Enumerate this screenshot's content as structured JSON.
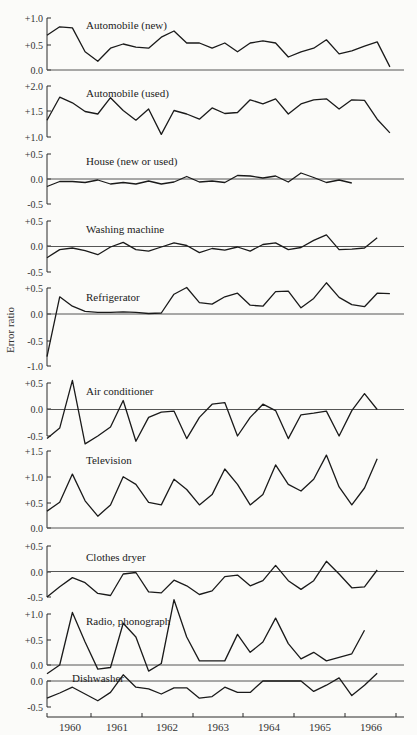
{
  "chart_data": {
    "type": "line",
    "title": "",
    "xlabel": "",
    "ylabel": "Error ratio",
    "x_tick_labels": [
      "1960",
      "1961",
      "1962",
      "1963",
      "1964",
      "1965",
      "1966"
    ],
    "frequency": "quarterly",
    "grid": false,
    "legend": "none (panel labels inline)",
    "panels": [
      {
        "name": "Automobile (new)",
        "ylim": [
          0.0,
          1.0
        ],
        "ticks": [
          "+1.0",
          "+0.5",
          "0.0"
        ],
        "zero_line": true,
        "values": [
          0.67,
          0.83,
          0.81,
          0.35,
          0.17,
          0.42,
          0.5,
          0.44,
          0.42,
          0.63,
          0.75,
          0.52,
          0.52,
          0.42,
          0.52,
          0.35,
          0.52,
          0.56,
          0.52,
          0.25,
          0.35,
          0.42,
          0.58,
          0.31,
          0.37,
          0.46,
          0.54,
          0.06
        ]
      },
      {
        "name": "Automobile (used)",
        "ylim": [
          1.0,
          2.0
        ],
        "ticks": [
          "+2.0",
          "+1.5",
          "+1.0"
        ],
        "zero_line": false,
        "values": [
          1.33,
          1.78,
          1.67,
          1.5,
          1.45,
          1.77,
          1.52,
          1.33,
          1.55,
          1.05,
          1.52,
          1.45,
          1.35,
          1.57,
          1.46,
          1.48,
          1.73,
          1.65,
          1.75,
          1.45,
          1.65,
          1.73,
          1.75,
          1.55,
          1.73,
          1.72,
          1.35,
          1.08
        ]
      },
      {
        "name": "House (new or used)",
        "ylim": [
          -0.5,
          0.5
        ],
        "ticks": [
          "+0.5",
          "0.0",
          "-0.5"
        ],
        "zero_line": true,
        "values": [
          -0.15,
          -0.05,
          -0.05,
          -0.07,
          -0.02,
          -0.1,
          -0.07,
          -0.1,
          -0.04,
          -0.1,
          -0.06,
          0.05,
          -0.06,
          -0.04,
          -0.07,
          0.07,
          0.06,
          0.02,
          0.06,
          -0.06,
          0.12,
          0.03,
          -0.07,
          -0.02,
          -0.08
        ]
      },
      {
        "name": "Washing machine",
        "ylim": [
          -0.5,
          0.5
        ],
        "ticks": [
          "+0.5",
          "0.0",
          "-0.5"
        ],
        "zero_line": true,
        "values": [
          -0.22,
          -0.06,
          -0.03,
          -0.08,
          -0.16,
          -0.01,
          0.08,
          -0.06,
          -0.09,
          -0.01,
          0.07,
          0.02,
          -0.12,
          -0.04,
          -0.07,
          -0.01,
          -0.09,
          0.04,
          0.07,
          -0.06,
          -0.02,
          0.12,
          0.23,
          -0.06,
          -0.05,
          -0.03,
          0.17
        ]
      },
      {
        "name": "Refrigerator",
        "ylim": [
          -1.0,
          0.5
        ],
        "ticks": [
          "+0.5",
          "0.0",
          "-0.5",
          "-1.0"
        ],
        "zero_line": true,
        "values": [
          -0.82,
          0.33,
          0.15,
          0.05,
          0.03,
          0.03,
          0.04,
          0.03,
          0.01,
          0.02,
          0.38,
          0.51,
          0.22,
          0.19,
          0.33,
          0.4,
          0.17,
          0.15,
          0.43,
          0.44,
          0.12,
          0.3,
          0.6,
          0.32,
          0.18,
          0.14,
          0.4,
          0.39
        ]
      },
      {
        "name": "Air conditioner",
        "ylim": [
          -0.5,
          0.5
        ],
        "ticks": [
          "+0.5",
          "0.0",
          "-0.5"
        ],
        "zero_line": true,
        "values": [
          -0.55,
          -0.35,
          0.55,
          -0.65,
          -0.5,
          -0.33,
          0.17,
          -0.6,
          -0.15,
          -0.05,
          -0.03,
          -0.55,
          -0.15,
          0.1,
          0.13,
          -0.5,
          -0.15,
          0.1,
          -0.02,
          -0.55,
          -0.1,
          -0.07,
          -0.03,
          -0.5,
          -0.02,
          0.3,
          0.0
        ]
      },
      {
        "name": "Television",
        "ylim": [
          0.0,
          1.5
        ],
        "ticks": [
          "+1.5",
          "+1.0",
          "+0.5",
          "0.0"
        ],
        "zero_line": false,
        "values": [
          0.33,
          0.5,
          1.05,
          0.53,
          0.23,
          0.45,
          1.0,
          0.85,
          0.5,
          0.45,
          0.95,
          0.75,
          0.45,
          0.65,
          1.15,
          0.85,
          0.45,
          0.65,
          1.23,
          0.85,
          0.72,
          0.95,
          1.42,
          0.8,
          0.45,
          0.78,
          1.35
        ]
      },
      {
        "name": "Clothes dryer",
        "ylim": [
          -0.5,
          0.5
        ],
        "ticks": [
          "+0.5",
          "0.0",
          "-0.5"
        ],
        "zero_line": true,
        "values": [
          -0.5,
          -0.3,
          -0.12,
          -0.22,
          -0.43,
          -0.47,
          -0.05,
          -0.02,
          -0.4,
          -0.42,
          -0.17,
          -0.28,
          -0.45,
          -0.38,
          -0.1,
          -0.07,
          -0.28,
          -0.18,
          0.12,
          -0.18,
          -0.35,
          -0.18,
          0.2,
          -0.05,
          -0.32,
          -0.3,
          0.03
        ]
      },
      {
        "name": "Radio, phonograph",
        "ylim": [
          0.0,
          1.0
        ],
        "ticks": [
          "+1.0",
          "+0.5",
          "0.0"
        ],
        "zero_line": true,
        "values": [
          -0.17,
          0.0,
          1.03,
          0.45,
          -0.08,
          -0.05,
          0.82,
          0.55,
          -0.12,
          0.03,
          1.28,
          0.55,
          0.08,
          0.08,
          0.08,
          0.6,
          0.25,
          0.45,
          0.92,
          0.42,
          0.12,
          0.25,
          0.08,
          0.15,
          0.22,
          0.68
        ]
      },
      {
        "name": "Dishwasher",
        "ylim": [
          -0.5,
          0.0
        ],
        "ticks": [
          "0.0",
          "-0.5"
        ],
        "zero_line": true,
        "values": [
          -0.33,
          -0.23,
          -0.12,
          -0.25,
          -0.38,
          -0.22,
          0.12,
          -0.12,
          -0.15,
          -0.25,
          -0.13,
          -0.13,
          -0.33,
          -0.3,
          -0.12,
          -0.22,
          -0.22,
          0.0,
          0.0,
          0.0,
          0.0,
          -0.2,
          -0.08,
          0.06,
          -0.28,
          -0.08,
          0.15
        ]
      }
    ]
  },
  "layout": {
    "x0": 47,
    "dx": 12.7,
    "axis_left": 47,
    "axis_right": 404,
    "axis_y": 717,
    "year_ticks_x": [
      47,
      91,
      142,
      193,
      243,
      294,
      345,
      396
    ],
    "year_label_x": [
      70,
      117,
      167,
      218,
      269,
      320,
      371
    ],
    "ylabel_x": 14,
    "ylabel_y": 330,
    "panels": [
      {
        "top": 18,
        "bottom": 70,
        "px": [
          [
            1.0,
            18
          ],
          [
            0.0,
            70
          ]
        ],
        "tick_y": [
          18,
          45,
          70
        ],
        "label_x": 86,
        "label_y": 25
      },
      {
        "top": 86,
        "bottom": 137,
        "px": [
          [
            2.0,
            86
          ],
          [
            1.0,
            137
          ]
        ],
        "tick_y": [
          86,
          111,
          137
        ],
        "label_x": 86,
        "label_y": 93
      },
      {
        "top": 154,
        "bottom": 204,
        "px": [
          [
            0.5,
            154
          ],
          [
            -0.5,
            204
          ]
        ],
        "tick_y": [
          154,
          179,
          204
        ],
        "label_x": 86,
        "label_y": 161
      },
      {
        "top": 221,
        "bottom": 272,
        "px": [
          [
            0.5,
            221
          ],
          [
            -0.5,
            272
          ]
        ],
        "tick_y": [
          221,
          246,
          272
        ],
        "label_x": 86,
        "label_y": 229
      },
      {
        "top": 288,
        "bottom": 366,
        "px": [
          [
            0.5,
            288
          ],
          [
            -1.0,
            366
          ]
        ],
        "tick_y": [
          288,
          314,
          341,
          366
        ],
        "label_x": 86,
        "label_y": 297
      },
      {
        "top": 383,
        "bottom": 436,
        "px": [
          [
            0.5,
            383
          ],
          [
            -0.5,
            436
          ]
        ],
        "tick_y": [
          383,
          409,
          436
        ],
        "label_x": 86,
        "label_y": 391
      },
      {
        "top": 451,
        "bottom": 528,
        "px": [
          [
            1.5,
            451
          ],
          [
            0.0,
            528
          ]
        ],
        "tick_y": [
          451,
          477,
          503,
          528
        ],
        "label_x": 86,
        "label_y": 460
      },
      {
        "top": 546,
        "bottom": 597,
        "px": [
          [
            0.5,
            546
          ],
          [
            -0.5,
            597
          ]
        ],
        "tick_y": [
          546,
          572,
          597
        ],
        "label_x": 86,
        "label_y": 557
      },
      {
        "top": 614,
        "bottom": 665,
        "px": [
          [
            1.0,
            614
          ],
          [
            0.0,
            665
          ]
        ],
        "tick_y": [
          614,
          640,
          665
        ],
        "label_x": 86,
        "label_y": 621
      },
      {
        "top": 681,
        "bottom": 707,
        "px": [
          [
            0.0,
            681
          ],
          [
            -0.5,
            707
          ]
        ],
        "tick_y": [
          681,
          707
        ],
        "label_x": 72,
        "label_y": 678
      }
    ]
  }
}
